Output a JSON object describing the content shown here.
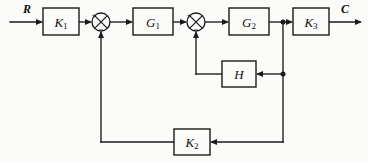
{
  "diagram": {
    "type": "control-system-block-diagram",
    "title": "",
    "background_color": "#fbfbf9",
    "line_color": "#1a1a1a",
    "signals": {
      "input_label": "R",
      "output_label": "C"
    },
    "blocks": [
      {
        "id": "K1",
        "base": "K",
        "sub": "1",
        "x": 43,
        "y": 8,
        "w": 36,
        "h": 27
      },
      {
        "id": "G1",
        "base": "G",
        "sub": "1",
        "x": 133,
        "y": 8,
        "w": 40,
        "h": 27
      },
      {
        "id": "G2",
        "base": "G",
        "sub": "2",
        "x": 229,
        "y": 8,
        "w": 40,
        "h": 27
      },
      {
        "id": "K3",
        "base": "K",
        "sub": "3",
        "x": 293,
        "y": 8,
        "w": 36,
        "h": 27
      },
      {
        "id": "H",
        "base": "H",
        "sub": "",
        "x": 222,
        "y": 61,
        "w": 34,
        "h": 26
      },
      {
        "id": "K2",
        "base": "K",
        "sub": "2",
        "x": 174,
        "y": 129,
        "w": 36,
        "h": 26
      }
    ],
    "summing_junctions": [
      {
        "id": "sum1",
        "cx": 101,
        "cy": 22,
        "r": 9,
        "signs": {
          "left": "+",
          "bottom": "−"
        }
      },
      {
        "id": "sum2",
        "cx": 196,
        "cy": 22,
        "r": 9,
        "signs": {
          "left": "+",
          "bottom": "−"
        }
      }
    ],
    "junction_nodes": [
      {
        "id": "tap-g2-out",
        "cx": 283,
        "cy": 22
      },
      {
        "id": "tap-inner-h",
        "cx": 283,
        "cy": 74
      }
    ],
    "paths": {
      "forward": "R → K1 → Σ1 → G1 → Σ2 → G2 → K3 → C",
      "inner_feedback": "G2 output → H → Σ2",
      "outer_feedback": "G2 output → K2 → Σ1"
    }
  }
}
